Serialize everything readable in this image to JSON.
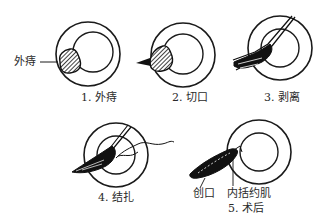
{
  "diagram": {
    "panels": [
      {
        "step": "1",
        "caption": "1. 外痔",
        "callout": "外痔"
      },
      {
        "step": "2",
        "caption": "2. 切口"
      },
      {
        "step": "3",
        "caption": "3. 剥离"
      },
      {
        "step": "4",
        "caption": "4. 结扎"
      },
      {
        "step": "5",
        "caption": "5. 术后",
        "callouts": [
          "创口",
          "内括约肌"
        ]
      }
    ],
    "colors": {
      "line": "#1a1a1a",
      "background": "#ffffff"
    }
  }
}
